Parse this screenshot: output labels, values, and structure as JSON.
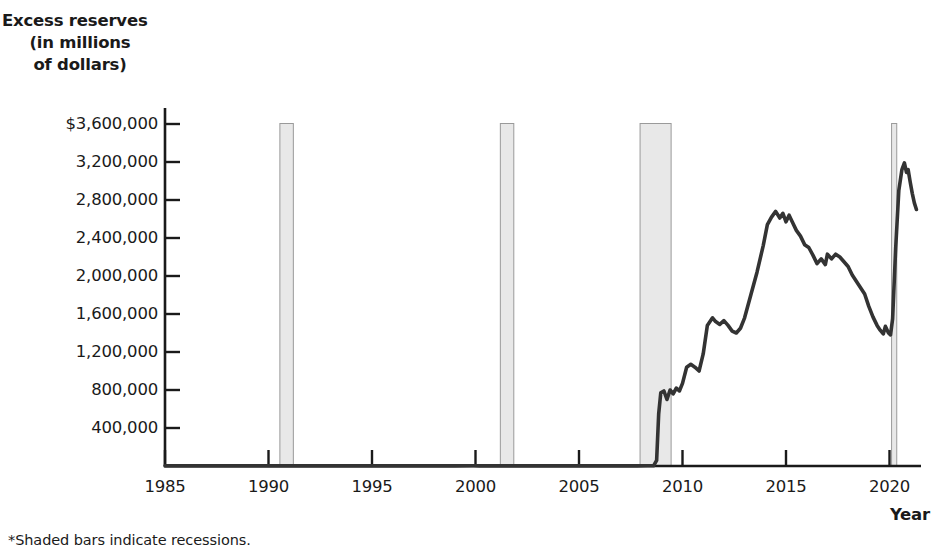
{
  "chart_data": {
    "type": "line",
    "title": "",
    "subtitle": "",
    "ylabel_lines": [
      "Excess reserves",
      "(in millions",
      "of dollars)"
    ],
    "ylabel": "Excess reserves (in millions of dollars)",
    "xlabel": "Year",
    "footnote": "*Shaded bars indicate recessions.",
    "xlim": [
      1985,
      2021.6
    ],
    "ylim": [
      0,
      3700000
    ],
    "grid": false,
    "legend_position": "none",
    "ytick_labels": [
      "$3,600,000",
      "3,200,000",
      "2,800,000",
      "2,400,000",
      "2,000,000",
      "1,600,000",
      "1,200,000",
      "800,000",
      "400,000"
    ],
    "ytick_values": [
      3600000,
      3200000,
      2800000,
      2400000,
      2000000,
      1600000,
      1200000,
      800000,
      400000
    ],
    "xtick_labels": [
      "1985",
      "1990",
      "1995",
      "2000",
      "2005",
      "2010",
      "2015",
      "2020"
    ],
    "xtick_values": [
      1985,
      1990,
      1995,
      2000,
      2005,
      2010,
      2015,
      2020
    ],
    "line_color": "#333333",
    "recession_fill": "#e8e8e8",
    "recession_stroke": "#9a9a9a",
    "axis_color": "#1a1a1a",
    "recessions": [
      {
        "start": 1990.55,
        "end": 1991.2
      },
      {
        "start": 2001.2,
        "end": 2001.85
      },
      {
        "start": 2007.95,
        "end": 2009.45
      },
      {
        "start": 2020.1,
        "end": 2020.35
      }
    ],
    "series": [
      {
        "name": "Excess reserves",
        "points": [
          [
            1985.0,
            1000
          ],
          [
            1986.0,
            1200
          ],
          [
            1987.0,
            1100
          ],
          [
            1988.0,
            1300
          ],
          [
            1989.0,
            1200
          ],
          [
            1990.0,
            1400
          ],
          [
            1991.0,
            1500
          ],
          [
            1992.0,
            1400
          ],
          [
            1993.0,
            1300
          ],
          [
            1994.0,
            1200
          ],
          [
            1995.0,
            1300
          ],
          [
            1996.0,
            1400
          ],
          [
            1997.0,
            1300
          ],
          [
            1998.0,
            1400
          ],
          [
            1999.0,
            1600
          ],
          [
            1999.9,
            2400
          ],
          [
            2000.2,
            1400
          ],
          [
            2001.0,
            1300
          ],
          [
            2001.7,
            1700
          ],
          [
            2002.0,
            1400
          ],
          [
            2003.0,
            1300
          ],
          [
            2004.0,
            1400
          ],
          [
            2005.0,
            1400
          ],
          [
            2006.0,
            1500
          ],
          [
            2007.0,
            1600
          ],
          [
            2007.8,
            1700
          ],
          [
            2008.3,
            1900
          ],
          [
            2008.6,
            2200
          ],
          [
            2008.75,
            60000
          ],
          [
            2008.85,
            550000
          ],
          [
            2008.95,
            770000
          ],
          [
            2009.1,
            790000
          ],
          [
            2009.25,
            700000
          ],
          [
            2009.4,
            800000
          ],
          [
            2009.55,
            760000
          ],
          [
            2009.7,
            820000
          ],
          [
            2009.85,
            790000
          ],
          [
            2010.0,
            870000
          ],
          [
            2010.2,
            1040000
          ],
          [
            2010.4,
            1070000
          ],
          [
            2010.6,
            1040000
          ],
          [
            2010.8,
            1000000
          ],
          [
            2011.0,
            1180000
          ],
          [
            2011.2,
            1480000
          ],
          [
            2011.45,
            1560000
          ],
          [
            2011.6,
            1520000
          ],
          [
            2011.8,
            1490000
          ],
          [
            2012.0,
            1530000
          ],
          [
            2012.2,
            1480000
          ],
          [
            2012.4,
            1420000
          ],
          [
            2012.6,
            1400000
          ],
          [
            2012.8,
            1450000
          ],
          [
            2013.0,
            1560000
          ],
          [
            2013.3,
            1800000
          ],
          [
            2013.6,
            2040000
          ],
          [
            2013.9,
            2320000
          ],
          [
            2014.1,
            2540000
          ],
          [
            2014.3,
            2620000
          ],
          [
            2014.5,
            2680000
          ],
          [
            2014.7,
            2610000
          ],
          [
            2014.85,
            2660000
          ],
          [
            2015.0,
            2570000
          ],
          [
            2015.15,
            2640000
          ],
          [
            2015.3,
            2570000
          ],
          [
            2015.5,
            2480000
          ],
          [
            2015.7,
            2420000
          ],
          [
            2015.9,
            2330000
          ],
          [
            2016.1,
            2300000
          ],
          [
            2016.3,
            2220000
          ],
          [
            2016.5,
            2130000
          ],
          [
            2016.7,
            2180000
          ],
          [
            2016.9,
            2120000
          ],
          [
            2017.0,
            2230000
          ],
          [
            2017.2,
            2180000
          ],
          [
            2017.4,
            2230000
          ],
          [
            2017.6,
            2200000
          ],
          [
            2017.8,
            2150000
          ],
          [
            2018.0,
            2100000
          ],
          [
            2018.2,
            2010000
          ],
          [
            2018.5,
            1910000
          ],
          [
            2018.8,
            1810000
          ],
          [
            2019.0,
            1680000
          ],
          [
            2019.2,
            1570000
          ],
          [
            2019.4,
            1480000
          ],
          [
            2019.55,
            1430000
          ],
          [
            2019.7,
            1390000
          ],
          [
            2019.8,
            1470000
          ],
          [
            2019.95,
            1400000
          ],
          [
            2020.05,
            1380000
          ],
          [
            2020.15,
            1550000
          ],
          [
            2020.3,
            2300000
          ],
          [
            2020.45,
            2900000
          ],
          [
            2020.6,
            3120000
          ],
          [
            2020.72,
            3190000
          ],
          [
            2020.82,
            3090000
          ],
          [
            2020.9,
            3120000
          ],
          [
            2021.0,
            2990000
          ],
          [
            2021.1,
            2870000
          ],
          [
            2021.2,
            2770000
          ],
          [
            2021.3,
            2700000
          ]
        ]
      }
    ]
  },
  "axis_geometry": {
    "x_left_px": 165,
    "x_right_px": 921,
    "y_top_px": 124,
    "y_bottom_px": 466,
    "px_per_year": 20.7,
    "px_per_400k": 38
  }
}
